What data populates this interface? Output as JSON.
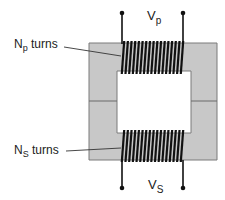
{
  "diagram": {
    "type": "transformer",
    "primary": {
      "label_main": "N",
      "label_sub": "p",
      "label_suffix": " turns",
      "voltage_main": "V",
      "voltage_sub": "p",
      "turns_drawn": 17
    },
    "secondary": {
      "label_main": "N",
      "label_sub": "S",
      "label_suffix": " turns",
      "voltage_main": "V",
      "voltage_sub": "S",
      "turns_drawn": 17
    },
    "colors": {
      "core_fill": "#c8c8c8",
      "core_stroke": "#7a7a7a",
      "coil": "#111111",
      "wire": "#111111",
      "background": "#ffffff"
    }
  }
}
